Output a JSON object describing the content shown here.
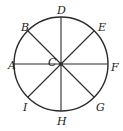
{
  "diagram": {
    "type": "circle-with-diameters",
    "center": {
      "label": "C",
      "x": 61,
      "y": 64,
      "label_x": 48,
      "label_y": 66
    },
    "radius": 47,
    "colors": {
      "stroke": "#2a2a2a",
      "text": "#222222",
      "background": "#ffffff"
    },
    "points": [
      {
        "label": "A",
        "x": 14,
        "y": 64,
        "label_x": 8,
        "label_y": 69
      },
      {
        "label": "B",
        "x": 28,
        "y": 31,
        "label_x": 21,
        "label_y": 31
      },
      {
        "label": "D",
        "x": 61,
        "y": 17,
        "label_x": 57,
        "label_y": 14
      },
      {
        "label": "E",
        "x": 94,
        "y": 31,
        "label_x": 98,
        "label_y": 31
      },
      {
        "label": "F",
        "x": 108,
        "y": 64,
        "label_x": 111,
        "label_y": 71
      },
      {
        "label": "G",
        "x": 94,
        "y": 97,
        "label_x": 96,
        "label_y": 111
      },
      {
        "label": "H",
        "x": 61,
        "y": 111,
        "label_x": 57,
        "label_y": 125
      },
      {
        "label": "I",
        "x": 28,
        "y": 97,
        "label_x": 23,
        "label_y": 111
      }
    ],
    "diameters": [
      [
        "A",
        "F"
      ],
      [
        "B",
        "G"
      ],
      [
        "D",
        "H"
      ],
      [
        "E",
        "I"
      ]
    ]
  }
}
